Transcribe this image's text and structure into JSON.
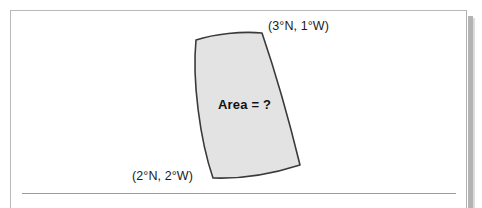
{
  "figure": {
    "shape_name": "curved-quadrilateral",
    "fill_color": "#e3e3e3",
    "stroke_color": "#3a3a3a",
    "background_color": "#ffffff",
    "border_color": "#b9b9b9",
    "shadow_color": "#b3b3b3",
    "rule_color": "#9c9c9c"
  },
  "labels": {
    "top_right_coordinate": "(3°N, 1°W)",
    "bottom_left_coordinate": "(2°N, 2°W)",
    "area_question": "Area = ?"
  },
  "chart_data": {
    "type": "diagram",
    "title": "",
    "xlabel": "",
    "ylabel": "",
    "annotations": [
      {
        "text": "(3°N, 1°W)",
        "anchor": "top-right-corner",
        "x": 268,
        "y": 27,
        "latitude_deg": 3,
        "latitude_hemisphere": "N",
        "longitude_deg": 1,
        "longitude_hemisphere": "W"
      },
      {
        "text": "(2°N, 2°W)",
        "anchor": "bottom-left-corner",
        "x": 132,
        "y": 177,
        "latitude_deg": 2,
        "latitude_hemisphere": "N",
        "longitude_deg": 2,
        "longitude_hemisphere": "W"
      },
      {
        "text": "Area = ?",
        "anchor": "shape-center",
        "x": 248,
        "y": 105
      }
    ],
    "shape": {
      "kind": "spherical-quadrilateral",
      "corners": [
        {
          "name": "top-left",
          "x": 196,
          "y": 40
        },
        {
          "name": "top-right",
          "x": 262,
          "y": 33
        },
        {
          "name": "bottom-right",
          "x": 300,
          "y": 165
        },
        {
          "name": "bottom-left",
          "x": 213,
          "y": 178
        }
      ],
      "edges": [
        {
          "name": "top",
          "curvature": "slightly-concave-up"
        },
        {
          "name": "right",
          "curvature": "convex-right"
        },
        {
          "name": "bottom",
          "curvature": "convex-down"
        },
        {
          "name": "left",
          "curvature": "concave-right"
        }
      ],
      "path": "M 196 40 C 214 34, 242 31, 262 33 C 276 74, 290 124, 300 165 C 272 174, 240 179, 213 178 C 200 140, 192 80, 196 40 Z"
    },
    "rule": {
      "x1": 22,
      "y1": 193,
      "x2": 456,
      "y2": 193
    }
  }
}
